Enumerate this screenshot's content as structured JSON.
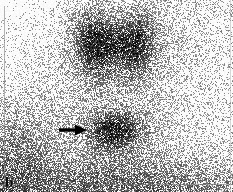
{
  "figure": {
    "panel_label": "b",
    "modality": "scintigraphy",
    "colors": {
      "background": "#ffffff",
      "speckle_dark": "#141414",
      "speckle_mid": "#5a5a5a",
      "annotation": "#000000",
      "border": "#9a9a9a"
    }
  },
  "annotations": {
    "arrow": {
      "name": "arrow-icon",
      "direction": "right",
      "tail_x": 59,
      "tail_y": 130,
      "tip_x": 87,
      "tip_y": 130,
      "shaft_thickness": 3,
      "head_length": 11,
      "head_width": 12,
      "color": "#000000"
    }
  },
  "chart_data": {
    "type": "heatmap",
    "title": "",
    "xlabel": "",
    "ylabel": "",
    "grid": false,
    "legend": "none",
    "width": 233,
    "height": 192,
    "colormap": "grayscale-inverted",
    "background_noise": {
      "base_density": 0.17,
      "top_left_falloff": true,
      "bottom_density": 0.42,
      "left_density": 0.3,
      "right_density": 0.14
    },
    "regions": [
      {
        "name": "thyroid-left-lobe",
        "cx": 94,
        "cy": 44,
        "rx": 19,
        "ry": 31,
        "intensity": 0.82,
        "rotation": -8
      },
      {
        "name": "thyroid-right-lobe",
        "cx": 136,
        "cy": 45,
        "rx": 18,
        "ry": 30,
        "intensity": 0.72,
        "rotation": 7
      },
      {
        "name": "thyroid-isthmus",
        "cx": 115,
        "cy": 40,
        "rx": 14,
        "ry": 16,
        "intensity": 0.38,
        "rotation": 0
      },
      {
        "name": "focal-uptake-lesion",
        "cx": 114,
        "cy": 130,
        "rx": 24,
        "ry": 17,
        "intensity": 0.86,
        "rotation": -4
      },
      {
        "name": "diffuse-halo-upper",
        "cx": 114,
        "cy": 48,
        "rx": 52,
        "ry": 48,
        "intensity": 0.22,
        "rotation": 0
      },
      {
        "name": "diffuse-halo-lower",
        "cx": 114,
        "cy": 134,
        "rx": 48,
        "ry": 32,
        "intensity": 0.2,
        "rotation": 0
      },
      {
        "name": "background-band-bottom",
        "cx": 116,
        "cy": 186,
        "rx": 122,
        "ry": 26,
        "intensity": 0.3,
        "rotation": 0
      },
      {
        "name": "background-band-left",
        "cx": 22,
        "cy": 150,
        "rx": 36,
        "ry": 44,
        "intensity": 0.22,
        "rotation": 0
      }
    ]
  }
}
